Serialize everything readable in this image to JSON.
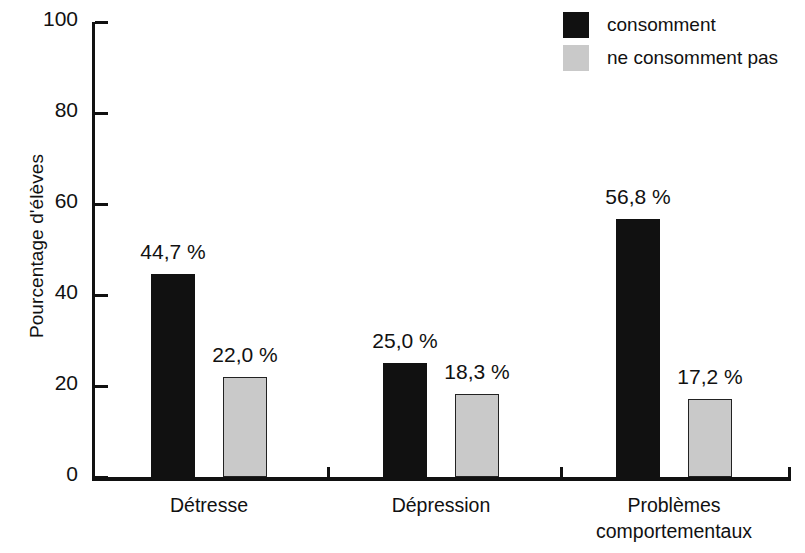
{
  "chart_data": {
    "type": "bar",
    "title": "",
    "xlabel": "",
    "ylabel": "Pourcentage d'élèves",
    "ylim": [
      0,
      100
    ],
    "yticks": [
      0,
      20,
      40,
      60,
      80,
      100
    ],
    "ytick_labels": [
      "0",
      "20",
      "40",
      "60",
      "80",
      "100"
    ],
    "grid": false,
    "legend_position": "top-right",
    "categories": [
      "Détresse",
      "Dépression",
      "Problèmes comportementaux"
    ],
    "category_lines": [
      [
        "Détresse"
      ],
      [
        "Dépression"
      ],
      [
        "Problèmes",
        "comportementaux"
      ]
    ],
    "series": [
      {
        "name": "consomment",
        "color": "#111111",
        "values": [
          44.7,
          25.0,
          56.8
        ],
        "value_labels": [
          "44,7 %",
          "25,0 %",
          "56,8 %"
        ]
      },
      {
        "name": "ne consomment pas",
        "color": "#c9c9c9",
        "values": [
          22.0,
          18.3,
          17.2
        ],
        "value_labels": [
          "22,0 %",
          "18,3 %",
          "17,2 %"
        ]
      }
    ]
  },
  "legend": {
    "items": [
      {
        "label": "consomment",
        "swatch": "black-square-icon"
      },
      {
        "label": "ne consomment pas",
        "swatch": "gray-square-icon"
      }
    ]
  }
}
